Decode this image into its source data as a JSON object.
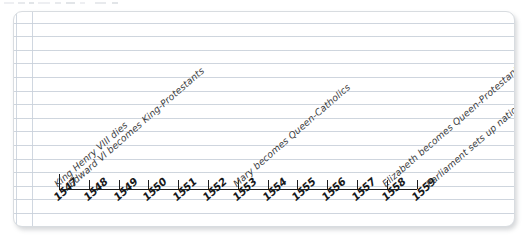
{
  "figure": {
    "kind": "hand-drawn-timeline",
    "medium": "lined notebook paper",
    "ink_color": "#1d1d1f",
    "label_color": "#3b3c40",
    "paper_color": "#ffffff",
    "rule_color": "#c6ced8"
  },
  "chart_data": {
    "type": "timeline",
    "title": "",
    "xlabel": "",
    "ylabel": "",
    "axis_range": [
      1547,
      1559
    ],
    "grid": false,
    "legend": "none",
    "tick_labels": [
      "1547",
      "1548",
      "1549",
      "1550",
      "1551",
      "1552",
      "1553",
      "1554",
      "1555",
      "1556",
      "1557",
      "1558",
      "1559"
    ],
    "events": [
      {
        "year": 1547,
        "label": "King Henry VIII dies"
      },
      {
        "year": 1547,
        "label": "Edward VI becomes King-Protestants"
      },
      {
        "year": 1553,
        "label": "Mary becomes Queen-Catholics"
      },
      {
        "year": 1558,
        "label": "Elizabeth becomes Queen-Protestants"
      },
      {
        "year": 1559,
        "label": "Parliament sets up national church"
      }
    ]
  }
}
